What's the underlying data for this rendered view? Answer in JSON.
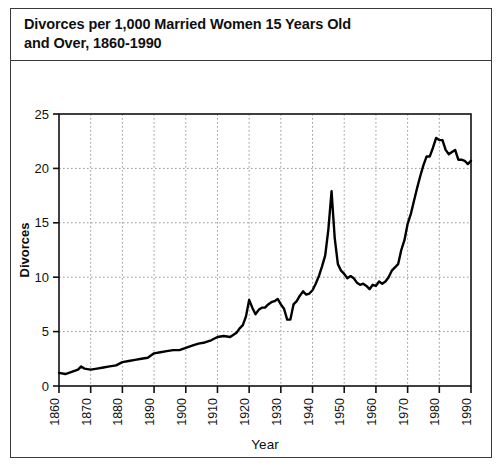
{
  "figure": {
    "title": "Divorces per 1,000 Married Women 15 Years Old\nand Over, 1860-1990",
    "border_color": "#3a3a3a",
    "background": "#ffffff"
  },
  "chart_data": {
    "type": "line",
    "title": "Divorces per 1,000 Married Women 15 Years Old and Over, 1860-1990",
    "xlabel": "Year",
    "ylabel": "Divorces",
    "xlim": [
      1860,
      1990
    ],
    "ylim": [
      0,
      25
    ],
    "yticks": [
      0,
      5,
      10,
      15,
      20,
      25
    ],
    "xticks": [
      1860,
      1870,
      1880,
      1890,
      1900,
      1910,
      1920,
      1930,
      1940,
      1950,
      1960,
      1970,
      1980,
      1990
    ],
    "grid": true,
    "grid_style": "dotted",
    "grid_color": "#9a9a9a",
    "legend": "none",
    "line_color": "#000000",
    "line_width": 2.4,
    "series": [
      {
        "name": "Divorces per 1,000 married women 15+",
        "x": [
          1860,
          1862,
          1864,
          1866,
          1867,
          1868,
          1870,
          1872,
          1874,
          1876,
          1878,
          1880,
          1882,
          1884,
          1886,
          1888,
          1890,
          1892,
          1894,
          1896,
          1898,
          1900,
          1902,
          1904,
          1906,
          1908,
          1910,
          1912,
          1914,
          1916,
          1917,
          1918,
          1919,
          1920,
          1921,
          1922,
          1923,
          1924,
          1925,
          1926,
          1927,
          1928,
          1929,
          1930,
          1931,
          1932,
          1933,
          1934,
          1935,
          1936,
          1937,
          1938,
          1939,
          1940,
          1941,
          1942,
          1943,
          1944,
          1945,
          1946,
          1947,
          1948,
          1949,
          1950,
          1951,
          1952,
          1953,
          1954,
          1955,
          1956,
          1957,
          1958,
          1959,
          1960,
          1961,
          1962,
          1963,
          1964,
          1965,
          1966,
          1967,
          1968,
          1969,
          1970,
          1971,
          1972,
          1973,
          1974,
          1975,
          1976,
          1977,
          1978,
          1979,
          1980,
          1981,
          1982,
          1983,
          1984,
          1985,
          1986,
          1987,
          1988,
          1989,
          1990
        ],
        "y": [
          1.2,
          1.1,
          1.3,
          1.5,
          1.8,
          1.6,
          1.5,
          1.6,
          1.7,
          1.8,
          1.9,
          2.2,
          2.3,
          2.4,
          2.5,
          2.6,
          3.0,
          3.1,
          3.2,
          3.3,
          3.3,
          3.5,
          3.7,
          3.9,
          4.0,
          4.2,
          4.5,
          4.6,
          4.5,
          4.9,
          5.3,
          5.6,
          6.4,
          7.9,
          7.2,
          6.6,
          7.0,
          7.2,
          7.2,
          7.5,
          7.7,
          7.8,
          8.0,
          7.5,
          7.1,
          6.1,
          6.1,
          7.5,
          7.8,
          8.3,
          8.7,
          8.4,
          8.5,
          8.8,
          9.4,
          10.1,
          11.0,
          12.0,
          14.4,
          17.9,
          13.6,
          11.2,
          10.6,
          10.3,
          9.9,
          10.1,
          9.9,
          9.5,
          9.3,
          9.4,
          9.2,
          8.9,
          9.3,
          9.2,
          9.6,
          9.4,
          9.6,
          10.0,
          10.6,
          10.9,
          11.2,
          12.5,
          13.4,
          14.9,
          15.8,
          17.0,
          18.2,
          19.3,
          20.3,
          21.1,
          21.1,
          21.9,
          22.8,
          22.6,
          22.6,
          21.7,
          21.3,
          21.5,
          21.7,
          20.8,
          20.8,
          20.7,
          20.4,
          20.7
        ]
      }
    ]
  },
  "axes": {
    "y_tick_labels": [
      "0",
      "5",
      "10",
      "15",
      "20",
      "25"
    ],
    "x_tick_labels": [
      "1860",
      "1870",
      "1880",
      "1890",
      "1900",
      "1910",
      "1920",
      "1930",
      "1940",
      "1950",
      "1960",
      "1970",
      "1980",
      "1990"
    ],
    "y_axis_title": "Divorces",
    "x_axis_title": "Year"
  }
}
